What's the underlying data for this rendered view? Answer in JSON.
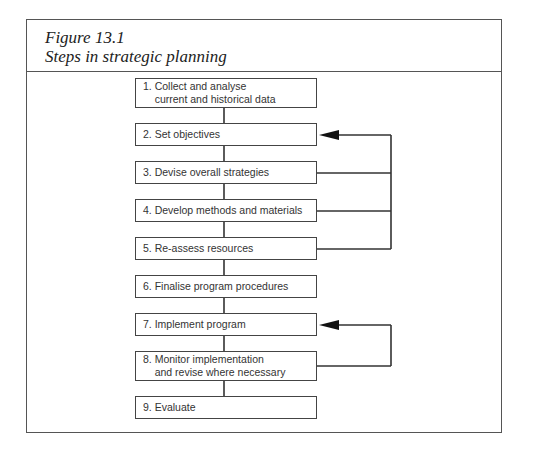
{
  "figure": {
    "label": "Figure 13.1",
    "caption": "Steps in strategic planning"
  },
  "steps": [
    {
      "line1": "1. Collect and analyse",
      "line2": "    current and historical data"
    },
    {
      "line1": "2. Set objectives"
    },
    {
      "line1": "3. Devise overall strategies"
    },
    {
      "line1": "4. Develop methods and materials"
    },
    {
      "line1": "5. Re-assess resources"
    },
    {
      "line1": "6. Finalise program procedures"
    },
    {
      "line1": "7. Implement program"
    },
    {
      "line1": "8. Monitor implementation",
      "line2": "    and revise where necessary"
    },
    {
      "line1": "9. Evaluate"
    }
  ],
  "feedback_loops": [
    {
      "from": [
        3,
        4,
        5
      ],
      "to": 2
    },
    {
      "from": [
        8
      ],
      "to": 7
    }
  ]
}
